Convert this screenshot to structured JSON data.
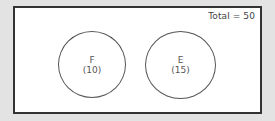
{
  "diagram": {
    "type": "venn",
    "total_label": "Total = 50",
    "sets": [
      {
        "name": "F",
        "count_label": "(10)",
        "count": 10
      },
      {
        "name": "E",
        "count_label": "(15)",
        "count": 15
      }
    ],
    "colors": {
      "background": "#e3e3e3",
      "frame_fill": "#ffffff",
      "frame_border": "#333333",
      "circle_stroke": "#555555",
      "text": "#555555"
    }
  }
}
